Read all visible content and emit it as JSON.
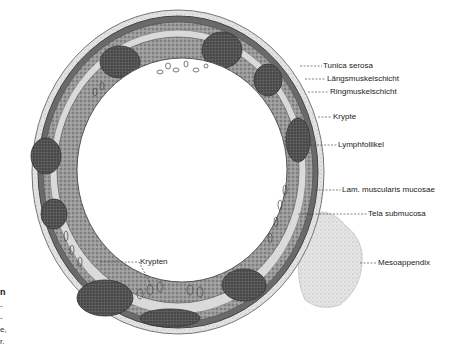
{
  "figure": {
    "labels": [
      {
        "id": "tunica-serosa",
        "text": "Tunica serosa",
        "x": 323,
        "y": 60,
        "lx1": 300,
        "ly1": 66
      },
      {
        "id": "laengsmuskelschicht",
        "text": "Längsmuskelschicht",
        "x": 327,
        "y": 73,
        "lx1": 305,
        "ly1": 79
      },
      {
        "id": "ringmuskelschicht",
        "text": "Ringmuskelschicht",
        "x": 330,
        "y": 86,
        "lx1": 308,
        "ly1": 92
      },
      {
        "id": "krypte",
        "text": "Krypte",
        "x": 333,
        "y": 112,
        "lx1": 318,
        "ly1": 117
      },
      {
        "id": "lymphfollikel",
        "text": "Lymphfollikel",
        "x": 338,
        "y": 140,
        "lx1": 310,
        "ly1": 145
      },
      {
        "id": "lam-muscularis-mucosae",
        "text": "Lam. muscularis mucosae",
        "x": 342,
        "y": 183,
        "lx1": 315,
        "ly1": 190
      },
      {
        "id": "tela-submucosa",
        "text": "Tela submucosa",
        "x": 368,
        "y": 209,
        "lx1": 298,
        "ly1": 214
      },
      {
        "id": "mesoappendix",
        "text": "Mesoappendix",
        "x": 378,
        "y": 258,
        "lx1": 360,
        "ly1": 263
      },
      {
        "id": "krypten",
        "text": "Krypten",
        "x": 140,
        "y": 256,
        "lx1": 100,
        "ly1": 262
      }
    ],
    "caption_fragments": [
      {
        "text": "n",
        "bold": true,
        "x": 0,
        "y": 289
      },
      {
        "text": "-",
        "bold": false,
        "x": 0,
        "y": 301
      },
      {
        "text": "-",
        "bold": false,
        "x": 0,
        "y": 313
      },
      {
        "text": "e,",
        "bold": false,
        "x": 0,
        "y": 325
      },
      {
        "text": "r.",
        "bold": false,
        "x": 0,
        "y": 337
      }
    ]
  },
  "colors": {
    "background": "#ffffff",
    "tissue_dark": "#4a4a4a",
    "tissue_mid": "#8a8a8a",
    "tissue_light": "#c8c8c8",
    "follicle": "#3c3c3c",
    "label_text": "#222222"
  }
}
